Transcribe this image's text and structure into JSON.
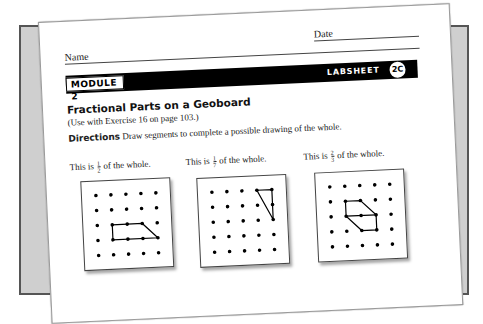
{
  "header": {
    "name_label": "Name",
    "date_label": "Date",
    "module_label": "MODULE 2",
    "labsheet_label": "LABSHEET",
    "labsheet_id": "2C"
  },
  "content": {
    "title": "Fractional Parts on a Geoboard",
    "subtitle": "(Use with Exercise 16 on page 103.)",
    "directions_label": "Directions",
    "directions_text": "Draw segments to complete a possible drawing of the whole."
  },
  "boards": [
    {
      "prompt_pre": "This is",
      "numerator": "1",
      "denominator": "2",
      "prompt_post": "of the whole.",
      "grid": "5x5",
      "shape": [
        [
          1,
          2
        ],
        [
          2,
          2
        ],
        [
          3,
          2
        ],
        [
          4,
          3
        ],
        [
          3,
          3
        ],
        [
          2,
          3
        ],
        [
          1,
          3
        ]
      ],
      "shape_desc": "trapezoid"
    },
    {
      "prompt_pre": "This is",
      "numerator": "1",
      "denominator": "7",
      "prompt_post": "of the whole.",
      "grid": "5x5",
      "shape": [
        [
          3,
          0
        ],
        [
          4,
          0
        ],
        [
          4,
          1
        ],
        [
          4,
          2
        ]
      ],
      "shape_desc": "right triangle"
    },
    {
      "prompt_pre": "This is",
      "numerator": "2",
      "denominator": "3",
      "prompt_post": "of the whole.",
      "grid": "5x5",
      "shape": [
        [
          1,
          1
        ],
        [
          2,
          1
        ],
        [
          3,
          2
        ],
        [
          3,
          3
        ],
        [
          2,
          3
        ],
        [
          1,
          2
        ]
      ],
      "shape_desc": "hexagon with midline"
    }
  ],
  "colors": {
    "frame": "#cfcfcf",
    "frame_border": "#555555",
    "bar": "#000000",
    "paper": "#ffffff"
  }
}
